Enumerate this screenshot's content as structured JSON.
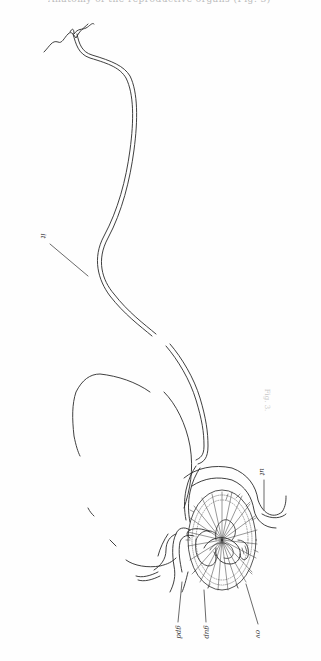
{
  "page": {
    "header": "Anatomy of the reproductive organs (Fig. 3)",
    "caption": "Fig. 3."
  },
  "figure": {
    "labels": [
      {
        "id": "it",
        "text": "it"
      },
      {
        "id": "ut",
        "text": "ut"
      },
      {
        "id": "gpd",
        "text": "gpd"
      },
      {
        "id": "gup",
        "text": "gup"
      },
      {
        "id": "ov",
        "text": "ov"
      }
    ],
    "stroke_color": "#2a2a2a"
  }
}
